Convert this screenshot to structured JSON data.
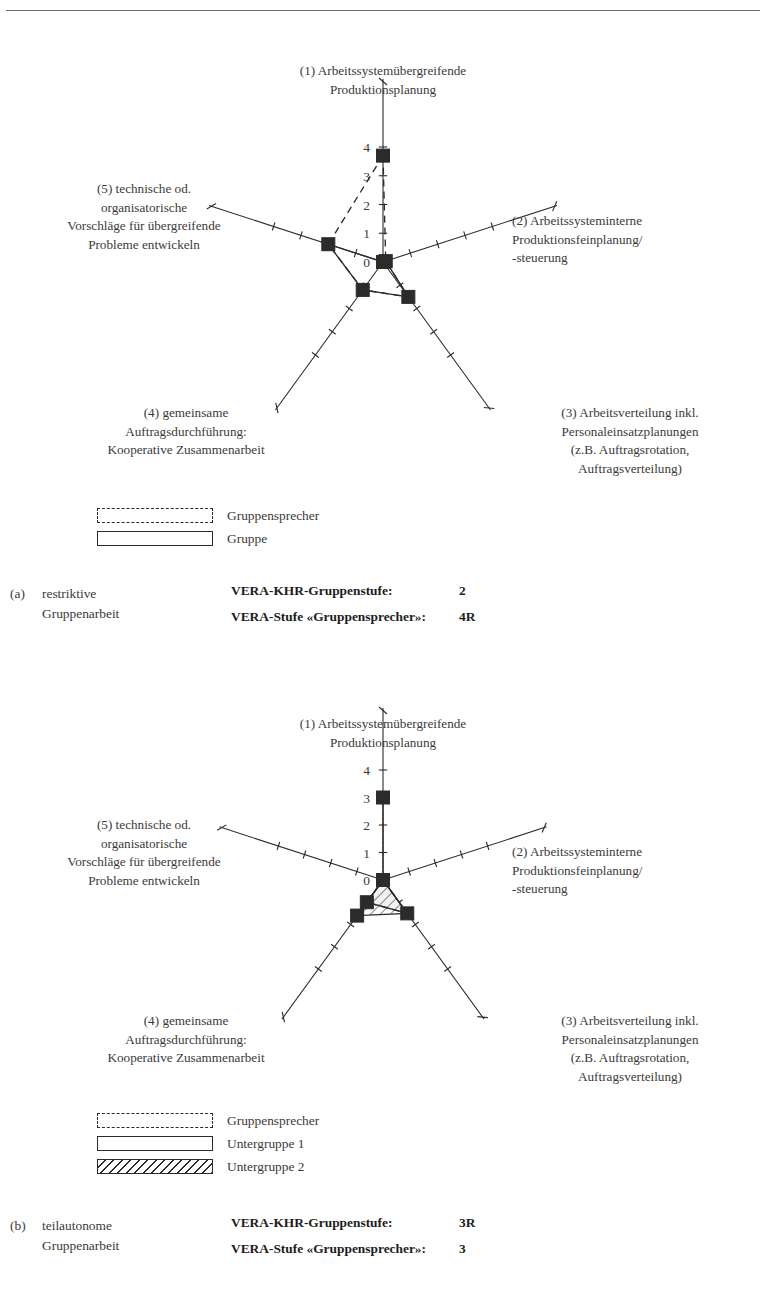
{
  "page": {
    "running_head": "",
    "background": "#ffffff",
    "ink": "#2b2b2b"
  },
  "axes": {
    "a1": "(1) Arbeitssystemübergreifende\nProduktionsplanung",
    "a2": "(2) Arbeitssysteminterne\nProduktionsfeinplanung/\n-steuerung",
    "a3": "(3) Arbeitsverteilung inkl.\nPersonaleinsatzplanungen\n(z.B. Auftragsrotation,\nAuftragsverteilung)",
    "a4": "(4) gemeinsame\nAuftragsdurchführung:\nKooperative Zusammenarbeit",
    "a5": "(5) technische od.\norganisatorische\nVorschläge für übergreifende\nProbleme entwickeln"
  },
  "ticks": [
    "0",
    "1",
    "2",
    "3",
    "4"
  ],
  "figure_a": {
    "legend": [
      {
        "label": "Gruppensprecher",
        "style": "dashed"
      },
      {
        "label": "Gruppe",
        "style": "solid"
      }
    ],
    "caption_tag": "(a)",
    "caption_text": "restriktive\nGruppenarbeit",
    "vera": [
      {
        "key": "VERA-KHR-Gruppenstufe:",
        "value": "2"
      },
      {
        "key": "VERA-Stufe «Gruppensprecher»:",
        "value": "4R"
      }
    ]
  },
  "figure_b": {
    "legend": [
      {
        "label": "Gruppensprecher",
        "style": "dashed"
      },
      {
        "label": "Untergruppe 1",
        "style": "solid"
      },
      {
        "label": "Untergruppe 2",
        "style": "hatched"
      }
    ],
    "caption_tag": "(b)",
    "caption_text": "teilautonome\nGruppenarbeit",
    "vera": [
      {
        "key": "VERA-KHR-Gruppenstufe:",
        "value": "3R"
      },
      {
        "key": "VERA-Stufe «Gruppensprecher»:",
        "value": "3"
      }
    ]
  },
  "chart_data": [
    {
      "id": "a",
      "type": "radar",
      "title": "(a) restriktive Gruppenarbeit",
      "categories": [
        "(1) Arbeitssystemübergreifende Produktionsplanung",
        "(2) Arbeitssysteminterne Produktionsfeinplanung/-steuerung",
        "(3) Arbeitsverteilung inkl. Personaleinsatzplanungen (z.B. Auftragsrotation, Auftragsverteilung)",
        "(4) gemeinsame Auftragsdurchführung: Kooperative Zusammenarbeit",
        "(5) technische od. organisatorische Vorschläge für übergreifende Probleme entwickeln"
      ],
      "rlim": [
        0,
        4
      ],
      "rticks": [
        0,
        1,
        2,
        3,
        4
      ],
      "grid": false,
      "legend_position": "below-left",
      "series": [
        {
          "name": "Gruppensprecher",
          "style": "dashed",
          "fill": "none",
          "values": [
            3.7,
            0.1,
            1.5,
            1.2,
            2.0
          ]
        },
        {
          "name": "Gruppe",
          "style": "solid",
          "fill": "none",
          "values": [
            0.0,
            0.1,
            1.5,
            1.2,
            2.0
          ]
        }
      ]
    },
    {
      "id": "b",
      "type": "radar",
      "title": "(b) teilautonome Gruppenarbeit",
      "categories": [
        "(1) Arbeitssystemübergreifende Produktionsplanung",
        "(2) Arbeitssysteminterne Produktionsfeinplanung/-steuerung",
        "(3) Arbeitsverteilung inkl. Personaleinsatzplanungen (z.B. Auftragsrotation, Auftragsverteilung)",
        "(4) gemeinsame Auftragsdurchführung: Kooperative Zusammenarbeit",
        "(5) technische od. organisatorische Vorschläge für übergreifende Probleme entwickeln"
      ],
      "rlim": [
        0,
        4
      ],
      "rticks": [
        0,
        1,
        2,
        3,
        4
      ],
      "grid": false,
      "legend_position": "below-left",
      "series": [
        {
          "name": "Gruppensprecher",
          "style": "dashed",
          "fill": "none",
          "values": [
            3.0,
            0.0,
            1.5,
            1.0,
            0.0
          ]
        },
        {
          "name": "Untergruppe 1",
          "style": "solid",
          "fill": "light",
          "values": [
            0.0,
            0.0,
            1.5,
            1.0,
            0.0
          ]
        },
        {
          "name": "Untergruppe 2",
          "style": "solid",
          "fill": "hatched",
          "values": [
            0.0,
            0.0,
            1.5,
            1.6,
            0.0
          ]
        }
      ]
    }
  ]
}
